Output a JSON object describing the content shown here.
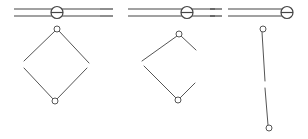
{
  "diagram": {
    "type": "mechanical-linkage-sequence",
    "stroke_color": "#555555",
    "background": "#ffffff",
    "panels": [
      {
        "id": "stage-1",
        "state": "open diamond",
        "rail": {
          "x1": 14,
          "x2": 100,
          "y_top": 9,
          "y_bottom": 16,
          "pin": {
            "cx": 57,
            "cy": 12.5,
            "r": 6
          },
          "dashed_lead": false
        },
        "linkage": {
          "top_pin": {
            "cx": 57,
            "cy": 29,
            "r": 3
          },
          "bottom_pin": {
            "cx": 55,
            "cy": 101,
            "r": 3
          },
          "segments": [
            [
              55,
              31,
              24,
              61
            ],
            [
              59,
              31,
              89,
              63
            ],
            [
              24,
              68,
              53,
              99
            ],
            [
              87,
              68,
              57,
              99
            ]
          ]
        }
      },
      {
        "id": "stage-2",
        "state": "partially folded",
        "rail": {
          "x1": 128,
          "x2": 215,
          "y_top": 9,
          "y_bottom": 16,
          "pin": {
            "cx": 187,
            "cy": 12.5,
            "r": 6
          },
          "dashed_lead": {
            "x1": 100,
            "x2": 113
          }
        },
        "linkage": {
          "top_pin": {
            "cx": 179,
            "cy": 34,
            "r": 3
          },
          "bottom_pin": {
            "cx": 178,
            "cy": 100,
            "r": 3
          },
          "segments": [
            [
              177,
              36,
              142,
              61
            ],
            [
              181,
              36,
              196,
              50
            ],
            [
              144,
              66,
              176,
              98
            ],
            [
              180,
              98,
              195,
              83
            ]
          ]
        }
      },
      {
        "id": "stage-3",
        "state": "fully collapsed",
        "rail": {
          "x1": 228,
          "x2": 282,
          "y_top": 9,
          "y_bottom": 16,
          "pin": {
            "cx": 287,
            "cy": 12.5,
            "r": 6
          },
          "dashed_lead": {
            "x1": 210,
            "x2": 222
          }
        },
        "linkage": {
          "top_pin": {
            "cx": 263,
            "cy": 29,
            "r": 3
          },
          "bottom_pin": {
            "cx": 269,
            "cy": 128,
            "r": 3
          },
          "segments": [
            [
              262,
              32,
              265,
              81
            ],
            [
              265,
              88,
              268,
              125
            ]
          ]
        }
      }
    ]
  }
}
